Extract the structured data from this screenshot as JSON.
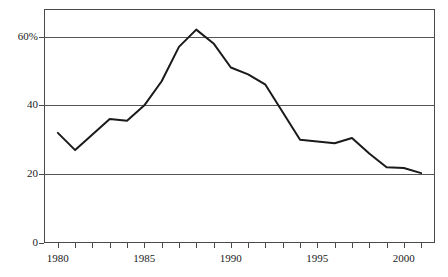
{
  "chart_data": {
    "type": "line",
    "title": "",
    "subtitle": "",
    "xlabel": "",
    "ylabel": "",
    "xlim": [
      1979.2,
      2001.8
    ],
    "ylim": [
      0,
      68
    ],
    "grid": true,
    "gridlines_y": [
      20,
      40,
      60
    ],
    "legend": null,
    "legend_position": "none",
    "annotations": [],
    "y_tick_labels": [
      "0",
      "20",
      "40",
      "60%"
    ],
    "y_ticks": [
      0,
      20,
      40,
      60
    ],
    "x_tick_labels": [
      "1980",
      "1985",
      "1990",
      "1995",
      "2000"
    ],
    "x_ticks_major": [
      1980,
      1985,
      1990,
      1995,
      2000
    ],
    "x_ticks_minor": [
      1980,
      1981,
      1982,
      1983,
      1984,
      1985,
      1986,
      1987,
      1988,
      1989,
      1990,
      1991,
      1992,
      1993,
      1994,
      1995,
      1996,
      1997,
      1998,
      1999,
      2000,
      2001
    ],
    "x": [
      1980,
      1981,
      1982,
      1983,
      1984,
      1985,
      1986,
      1987,
      1988,
      1989,
      1990,
      1991,
      1992,
      1993,
      1994,
      1995,
      1996,
      1997,
      1998,
      1999,
      2000,
      2001
    ],
    "values": [
      32,
      27,
      31.5,
      36,
      35.5,
      40,
      47,
      57,
      62,
      58,
      51,
      49,
      46,
      38,
      30,
      29.5,
      29,
      30.5,
      26,
      22,
      21.8,
      20.3
    ],
    "series": [
      {
        "name": "percent",
        "color": "#1a1a1a",
        "line_width": 2,
        "values": [
          32,
          27,
          31.5,
          36,
          35.5,
          40,
          47,
          57,
          62,
          58,
          51,
          49,
          46,
          38,
          30,
          29.5,
          29,
          30.5,
          26,
          22,
          21.8,
          20.3
        ]
      }
    ]
  },
  "colors": {
    "line": "#1a1a1a",
    "grid": "#555555",
    "frame": "#4a4a4a",
    "background": "#ffffff",
    "text": "#1a1a1a"
  }
}
